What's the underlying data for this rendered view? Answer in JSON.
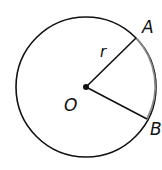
{
  "diagram": {
    "type": "circle-with-radii",
    "labels": {
      "center": "O",
      "point_a": "A",
      "point_b": "B",
      "radius": "r"
    },
    "colors": {
      "stroke": "#111111",
      "arc_ab": "#888888",
      "background": "#ffffff"
    }
  }
}
